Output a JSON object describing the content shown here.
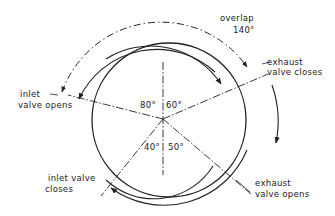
{
  "diagram": {
    "colors": {
      "line": "#222222",
      "background": "#ffffff"
    },
    "labels": {
      "overlap": "overlap",
      "overlap_angle": "140°",
      "exhaust_valve_closes_1": "exhaust",
      "exhaust_valve_closes_2": "valve closes",
      "inlet_valve_opens_1": "inlet",
      "inlet_valve_opens_2": "valve opens",
      "inlet_valve_closes_1": "inlet valve",
      "inlet_valve_closes_2": "closes",
      "exhaust_valve_opens_1": "exhaust",
      "exhaust_valve_opens_2": "valve opens"
    },
    "angles": {
      "inlet_opens_btdc": "80°",
      "exhaust_closes_atdc": "60°",
      "inlet_closes_abdc": "40°",
      "exhaust_opens_bbdc": "50°"
    }
  }
}
